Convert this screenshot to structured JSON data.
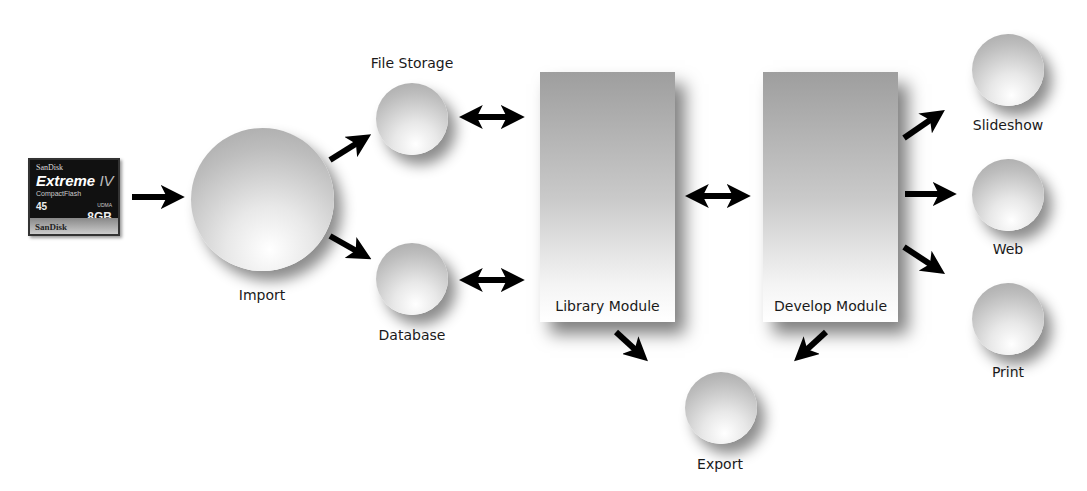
{
  "diagram": {
    "source": {
      "brand": "SanDisk",
      "product_prefix": "Extreme",
      "product_suffix": "IV",
      "type": "CompactFlash",
      "speed": "45",
      "speed_unit": "MB/s",
      "udma": "UDMA",
      "capacity": "8GB",
      "footer_brand": "SanDisk"
    },
    "nodes": {
      "import": "Import",
      "file_storage": "File Storage",
      "database": "Database",
      "library": "Library Module",
      "develop": "Develop Module",
      "export": "Export",
      "slideshow": "Slideshow",
      "web": "Web",
      "print": "Print"
    },
    "edges": [
      {
        "from": "card",
        "to": "Import",
        "type": "one-way"
      },
      {
        "from": "Import",
        "to": "File Storage",
        "type": "one-way"
      },
      {
        "from": "Import",
        "to": "Database",
        "type": "one-way"
      },
      {
        "from": "File Storage",
        "to": "Library Module",
        "type": "two-way"
      },
      {
        "from": "Database",
        "to": "Library Module",
        "type": "two-way"
      },
      {
        "from": "Library Module",
        "to": "Develop Module",
        "type": "two-way"
      },
      {
        "from": "Library Module",
        "to": "Export",
        "type": "one-way"
      },
      {
        "from": "Develop Module",
        "to": "Export",
        "type": "one-way"
      },
      {
        "from": "Develop Module",
        "to": "Slideshow",
        "type": "one-way"
      },
      {
        "from": "Develop Module",
        "to": "Web",
        "type": "one-way"
      },
      {
        "from": "Develop Module",
        "to": "Print",
        "type": "one-way"
      }
    ],
    "colors": {
      "arrow": "#000000",
      "background": "#ffffff",
      "text": "#1a1a1a"
    }
  }
}
